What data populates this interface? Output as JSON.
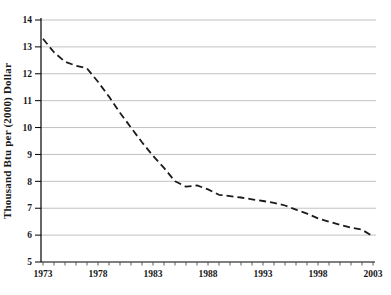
{
  "figure": {
    "background": "#ffffff",
    "plot": {
      "left": 41,
      "right": 376,
      "top": 20,
      "bottom": 262,
      "x_first": 43,
      "x_last": 373
    }
  },
  "chart_data": {
    "type": "line",
    "title": "",
    "xlabel": "",
    "ylabel": "Thousand Btu per (2000) Dollar",
    "x": [
      1973,
      1974,
      1975,
      1976,
      1977,
      1978,
      1979,
      1980,
      1981,
      1982,
      1983,
      1984,
      1985,
      1986,
      1987,
      1988,
      1989,
      1990,
      1991,
      1992,
      1993,
      1994,
      1995,
      1996,
      1997,
      1998,
      1999,
      2000,
      2001,
      2002,
      2003
    ],
    "series": [
      {
        "name": "energy-intensity",
        "values": [
          13.3,
          12.8,
          12.45,
          12.3,
          12.2,
          11.7,
          11.15,
          10.55,
          10.0,
          9.45,
          8.95,
          8.5,
          8.0,
          7.8,
          7.85,
          7.7,
          7.5,
          7.45,
          7.4,
          7.33,
          7.27,
          7.2,
          7.1,
          6.95,
          6.8,
          6.62,
          6.5,
          6.38,
          6.28,
          6.2,
          5.95
        ],
        "color": "#1b1b1b",
        "line_style": "dashed",
        "dash_pattern": "7 4",
        "stroke_width": 1.8
      }
    ],
    "xlim": [
      1973,
      2003
    ],
    "ylim": [
      5,
      14
    ],
    "y_ticks": [
      5,
      6,
      7,
      8,
      9,
      10,
      11,
      12,
      13,
      14
    ],
    "x_tick_labels": [
      "1973",
      "1978",
      "1983",
      "1988",
      "1993",
      "1998",
      "2003"
    ],
    "x_minor_tick_interval_years": 1,
    "grid": "horizontal",
    "grid_color": "#c2c2c2",
    "axis_color": "#000000",
    "minor_tick_color": "#4a4a4a",
    "legend": "none"
  }
}
